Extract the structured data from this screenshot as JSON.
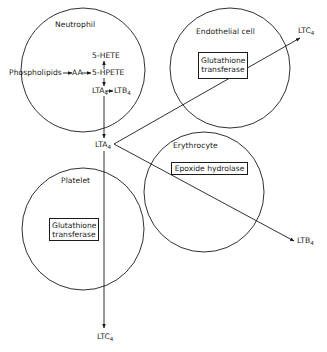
{
  "diagram": {
    "type": "leukotriene transcellular metabolism",
    "cells": [
      {
        "id": "neutrophil",
        "label": "Neutrophil",
        "center": [
          83,
          70
        ],
        "radius": 62
      },
      {
        "id": "endothelial",
        "label": "Endothelial cell",
        "center": [
          230,
          68
        ],
        "radius": 60,
        "enzyme": "Glutathione transferase"
      },
      {
        "id": "erythrocyte",
        "label": "Erythrocyte",
        "center": [
          204,
          192
        ],
        "radius": 60,
        "enzyme": "Epoxide hydrolase"
      },
      {
        "id": "platelet",
        "label": "Platelet",
        "center": [
          83,
          229
        ],
        "radius": 61,
        "enzyme": "Glutathione transferase"
      }
    ],
    "neutrophil_pathway": {
      "phospholipids": "Phospholipids",
      "aa": "AA",
      "hpete": "5-HPETE",
      "hete": "5-HETE",
      "lta4": "LTA",
      "lta4_sub": "4",
      "ltb4": "LTB",
      "ltb4_sub": "4"
    },
    "central_node": {
      "label": "LTA",
      "sub": "4"
    },
    "products": {
      "endothelial_out": {
        "label": "LTC",
        "sub": "4"
      },
      "erythrocyte_out": {
        "label": "LTB",
        "sub": "4"
      },
      "platelet_out": {
        "label": "LTC",
        "sub": "4"
      }
    },
    "enzymes": {
      "endothelial_line1": "Glutathione",
      "endothelial_line2": "transferase",
      "erythrocyte": "Epoxide hydrolase",
      "platelet_line1": "Glutathione",
      "platelet_line2": "transferase"
    },
    "colors": {
      "stroke": "#1a1a1a",
      "background": "#ffffff"
    }
  }
}
